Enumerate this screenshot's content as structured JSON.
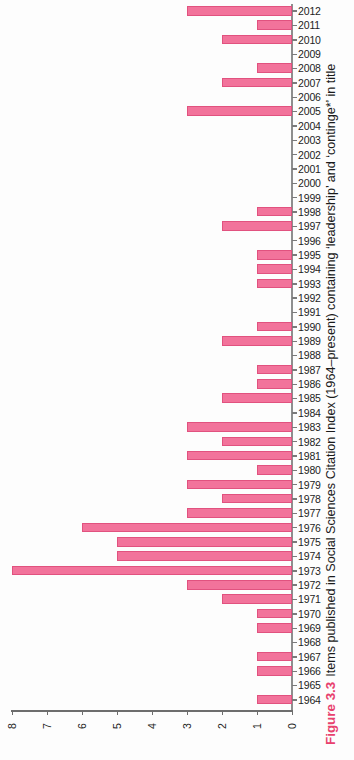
{
  "figure": {
    "number_label": "Figure 3.3",
    "caption_text": "Items published in Social Sciences Citation Index (1964–present) containing ‘leadership’ and ‘continge*’ in title",
    "accent_color": "#e8416e",
    "bar_fill_color": "#f2739b",
    "bar_border_color": "#e1527f",
    "axis_color": "#6d6d6d"
  },
  "chart_data": {
    "type": "bar",
    "orientation": "horizontal",
    "title": "Items published in Social Sciences Citation Index (1964–present) containing ‘leadership’ and ‘continge*’ in title",
    "xlabel": "",
    "ylabel": "",
    "xlim": [
      8,
      0
    ],
    "x_axis_reversed": true,
    "xticks": [
      8,
      7,
      6,
      5,
      4,
      3,
      2,
      1,
      0
    ],
    "xtick_labels": [
      "8",
      "7",
      "6",
      "5",
      "4",
      "3",
      "2",
      "1",
      "0"
    ],
    "grid": false,
    "legend": false,
    "categories": [
      "2012",
      "2011",
      "2010",
      "2009",
      "2008",
      "2007",
      "2006",
      "2005",
      "2004",
      "2003",
      "2002",
      "2001",
      "2000",
      "1999",
      "1998",
      "1997",
      "1996",
      "1995",
      "1994",
      "1993",
      "1992",
      "1991",
      "1990",
      "1989",
      "1988",
      "1987",
      "1986",
      "1985",
      "1984",
      "1983",
      "1982",
      "1981",
      "1980",
      "1979",
      "1978",
      "1977",
      "1976",
      "1975",
      "1974",
      "1973",
      "1972",
      "1971",
      "1970",
      "1969",
      "1968",
      "1967",
      "1966",
      "1965",
      "1964"
    ],
    "values": [
      3,
      1,
      2,
      0,
      1,
      2,
      0,
      3,
      0,
      0,
      0,
      0,
      0,
      0,
      1,
      2,
      0,
      1,
      1,
      1,
      0,
      0,
      1,
      2,
      0,
      1,
      1,
      2,
      0,
      3,
      2,
      3,
      1,
      3,
      2,
      3,
      6,
      5,
      5,
      8,
      3,
      2,
      1,
      1,
      0,
      1,
      1,
      0,
      1
    ]
  }
}
